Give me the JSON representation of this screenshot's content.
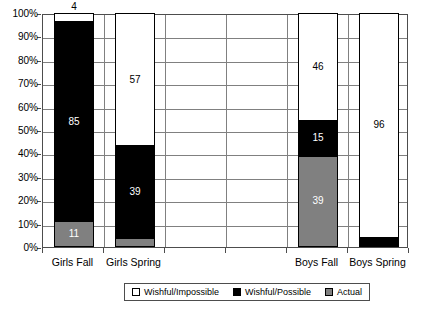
{
  "chart_data": {
    "type": "bar",
    "subtype": "stacked-100-percent",
    "title": "",
    "xlabel": "",
    "ylabel": "",
    "categories": [
      "Girls Fall",
      "Girls Spring",
      "",
      "",
      "Boys Fall",
      "Boys Spring"
    ],
    "visible_categories": [
      "Girls Fall",
      "Girls Spring",
      "Boys Fall",
      "Boys Spring"
    ],
    "series": [
      {
        "name": "Actual",
        "color": "#808080",
        "values": [
          11,
          4,
          null,
          null,
          39,
          0
        ]
      },
      {
        "name": "Wishful/Possible",
        "color": "#000000",
        "values": [
          85,
          39,
          null,
          null,
          15,
          4
        ]
      },
      {
        "name": "Wishful/Impossible",
        "color": "#ffffff",
        "values": [
          4,
          57,
          null,
          null,
          46,
          96
        ]
      }
    ],
    "stack_order_bottom_to_top": [
      "Actual",
      "Wishful/Possible",
      "Wishful/Impossible"
    ],
    "ylim": [
      0,
      100
    ],
    "ytick_labels": [
      "0%",
      "10%",
      "20%",
      "30%",
      "40%",
      "50%",
      "60%",
      "70%",
      "80%",
      "90%",
      "100%"
    ],
    "ytick_values": [
      0,
      10,
      20,
      30,
      40,
      50,
      60,
      70,
      80,
      90,
      100
    ],
    "grid": {
      "horizontal": true,
      "vertical": true
    },
    "legend": {
      "position": "bottom",
      "bordered": true
    }
  },
  "axis": {
    "y_labels": [
      "100%",
      "90%",
      "80%",
      "70%",
      "60%",
      "50%",
      "40%",
      "30%",
      "20%",
      "10%",
      "0%"
    ],
    "x_labels": [
      "Girls Fall",
      "Girls Spring",
      "Boys Fall",
      "Boys Spring"
    ]
  },
  "bars": [
    {
      "category": "Girls Fall",
      "segments": [
        {
          "series": "Wishful/Impossible",
          "value": 4,
          "label": "4",
          "fill": "white"
        },
        {
          "series": "Wishful/Possible",
          "value": 85,
          "label": "85",
          "fill": "black"
        },
        {
          "series": "Actual",
          "value": 11,
          "label": "11",
          "fill": "gray"
        }
      ]
    },
    {
      "category": "Girls Spring",
      "segments": [
        {
          "series": "Wishful/Impossible",
          "value": 57,
          "label": "57",
          "fill": "white"
        },
        {
          "series": "Wishful/Possible",
          "value": 39,
          "label": "39",
          "fill": "black"
        },
        {
          "series": "Actual",
          "value": 4,
          "label": "4",
          "fill": "gray"
        }
      ]
    },
    {
      "category": "Boys Fall",
      "segments": [
        {
          "series": "Wishful/Impossible",
          "value": 46,
          "label": "46",
          "fill": "white"
        },
        {
          "series": "Wishful/Possible",
          "value": 15,
          "label": "15",
          "fill": "black"
        },
        {
          "series": "Actual",
          "value": 39,
          "label": "39",
          "fill": "gray"
        }
      ]
    },
    {
      "category": "Boys Spring",
      "segments": [
        {
          "series": "Wishful/Impossible",
          "value": 96,
          "label": "96",
          "fill": "white"
        },
        {
          "series": "Wishful/Possible",
          "value": 4,
          "label": "4",
          "fill": "black"
        }
      ]
    }
  ],
  "legend": {
    "items": [
      {
        "label": "Wishful/Impossible",
        "fill": "white"
      },
      {
        "label": "Wishful/Possible",
        "fill": "black"
      },
      {
        "label": "Actual",
        "fill": "gray"
      }
    ]
  },
  "colors": {
    "white": "#ffffff",
    "black": "#000000",
    "gray": "#808080",
    "axis": "#4d4d4d",
    "grid": "#808080"
  }
}
